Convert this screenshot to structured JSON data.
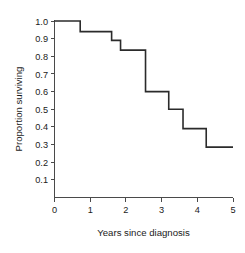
{
  "chart_data": {
    "type": "line",
    "subtype": "kaplan-meier-step",
    "title": "",
    "xlabel": "Years since diagnosis",
    "ylabel": "Proportion surviving",
    "xlim": [
      0,
      5
    ],
    "ylim": [
      0,
      1.0
    ],
    "grid": false,
    "legend": null,
    "xticks": [
      0,
      1,
      2,
      3,
      4,
      5
    ],
    "xtick_labels": [
      "0",
      "1",
      "2",
      "3",
      "4",
      "5"
    ],
    "yticks": [
      0.1,
      0.2,
      0.3,
      0.4,
      0.5,
      0.6,
      0.7,
      0.8,
      0.9,
      1.0
    ],
    "ytick_labels": [
      "0.1",
      "0.2",
      "0.3",
      "0.4",
      "0.5",
      "0.6",
      "0.7",
      "0.8",
      "0.9",
      "1.0"
    ],
    "series": [
      {
        "name": "Survival",
        "color": "#2b2b2b",
        "step": "post",
        "x": [
          0,
          0.72,
          1.6,
          1.85,
          2.55,
          3.2,
          3.6,
          4.25,
          5.0
        ],
        "y": [
          1.0,
          0.94,
          0.89,
          0.835,
          0.6,
          0.5,
          0.39,
          0.285,
          0.285
        ],
        "steps": [
          {
            "time": 0.0,
            "survival": 1.0
          },
          {
            "time": 0.72,
            "survival": 0.94
          },
          {
            "time": 1.6,
            "survival": 0.89
          },
          {
            "time": 1.85,
            "survival": 0.835
          },
          {
            "time": 2.55,
            "survival": 0.6
          },
          {
            "time": 3.2,
            "survival": 0.5
          },
          {
            "time": 3.6,
            "survival": 0.39
          },
          {
            "time": 4.25,
            "survival": 0.285
          },
          {
            "time": 5.0,
            "survival": 0.285
          }
        ]
      }
    ]
  }
}
